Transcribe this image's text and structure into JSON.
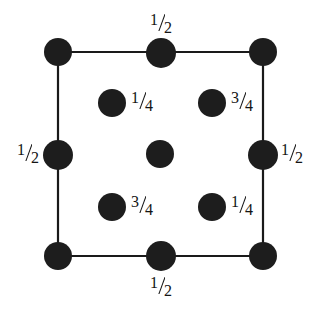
{
  "figure": {
    "width": 315,
    "height": 311,
    "background_color": "#ffffff",
    "atom_color": "#1d1d1d",
    "line_color": "#1a1a1a",
    "text_color": "#141414"
  },
  "cell": {
    "left": 58,
    "top": 52,
    "right": 263,
    "bottom": 256,
    "line_width": 2.2
  },
  "atoms": [
    {
      "id": "corner-top-left",
      "cx": 58,
      "cy": 52,
      "r": 14,
      "label": null,
      "role": "corner"
    },
    {
      "id": "edge-top-middle",
      "cx": 161,
      "cy": 53,
      "r": 15,
      "label": "1/2",
      "role": "edge"
    },
    {
      "id": "corner-top-right",
      "cx": 263,
      "cy": 52,
      "r": 14,
      "label": null,
      "role": "corner"
    },
    {
      "id": "interior-upper-left",
      "cx": 112,
      "cy": 103,
      "r": 14,
      "label": "1/4",
      "role": "interior"
    },
    {
      "id": "interior-upper-right",
      "cx": 212,
      "cy": 103,
      "r": 14,
      "label": "3/4",
      "role": "interior"
    },
    {
      "id": "edge-left-middle",
      "cx": 58,
      "cy": 155,
      "r": 15,
      "label": "1/2",
      "role": "edge"
    },
    {
      "id": "center",
      "cx": 160,
      "cy": 154,
      "r": 14,
      "label": null,
      "role": "center"
    },
    {
      "id": "edge-right-middle",
      "cx": 263,
      "cy": 155,
      "r": 15,
      "label": "1/2",
      "role": "edge"
    },
    {
      "id": "interior-lower-left",
      "cx": 112,
      "cy": 207,
      "r": 14,
      "label": "3/4",
      "role": "interior"
    },
    {
      "id": "interior-lower-right",
      "cx": 212,
      "cy": 207,
      "r": 14,
      "label": "1/4",
      "role": "interior"
    },
    {
      "id": "corner-bottom-left",
      "cx": 58,
      "cy": 256,
      "r": 14,
      "label": null,
      "role": "corner"
    },
    {
      "id": "edge-bottom-middle",
      "cx": 161,
      "cy": 256,
      "r": 15,
      "label": "1/2",
      "role": "edge"
    },
    {
      "id": "corner-bottom-right",
      "cx": 263,
      "cy": 256,
      "r": 14,
      "label": null,
      "role": "corner"
    }
  ],
  "labels": [
    {
      "id": "label-top",
      "numerator": "1",
      "denominator": "2",
      "x": 161,
      "y": 12,
      "anchor": "center"
    },
    {
      "id": "label-upper-left",
      "numerator": "1",
      "denominator": "4",
      "x": 131,
      "y": 90,
      "anchor": "left"
    },
    {
      "id": "label-upper-right",
      "numerator": "3",
      "denominator": "4",
      "x": 231,
      "y": 90,
      "anchor": "left"
    },
    {
      "id": "label-left",
      "numerator": "1",
      "denominator": "2",
      "x": 39,
      "y": 142,
      "anchor": "right"
    },
    {
      "id": "label-right",
      "numerator": "1",
      "denominator": "2",
      "x": 281,
      "y": 142,
      "anchor": "left"
    },
    {
      "id": "label-lower-left",
      "numerator": "3",
      "denominator": "4",
      "x": 131,
      "y": 194,
      "anchor": "left"
    },
    {
      "id": "label-lower-right",
      "numerator": "1",
      "denominator": "4",
      "x": 231,
      "y": 194,
      "anchor": "left"
    },
    {
      "id": "label-bottom",
      "numerator": "1",
      "denominator": "2",
      "x": 161,
      "y": 275,
      "anchor": "center"
    }
  ]
}
